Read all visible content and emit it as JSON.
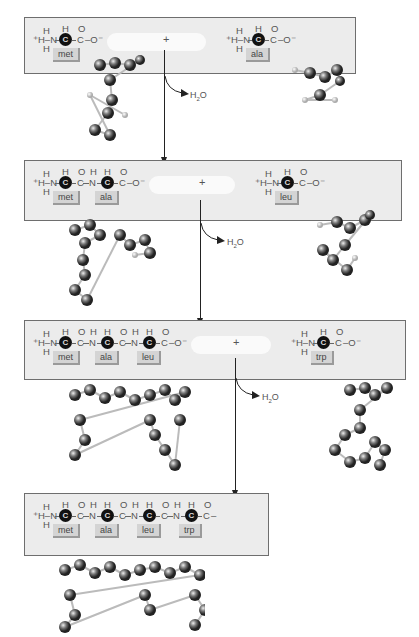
{
  "steps": [
    {
      "chain": [
        "met"
      ],
      "chain_terminal": "C–O⁻",
      "incoming": "ala",
      "byproduct": "H2O"
    },
    {
      "chain": [
        "met",
        "ala"
      ],
      "chain_terminal": "C–O⁻",
      "incoming": "leu",
      "byproduct": "H2O"
    },
    {
      "chain": [
        "met",
        "ala",
        "leu"
      ],
      "chain_terminal": "C–O⁻",
      "incoming": "trp",
      "byproduct": "H2O"
    },
    {
      "chain": [
        "met",
        "ala",
        "leu",
        "trp"
      ],
      "chain_terminal": "C–"
    }
  ],
  "labels": {
    "amino_n": "⁺H–N",
    "h": "H",
    "o": "O",
    "n": "N",
    "c": "C",
    "c_alpha": "C",
    "o_minus": "O⁻",
    "plus": "+",
    "water_h": "H",
    "water_sub": "2",
    "water_o": "O"
  },
  "residues": {
    "met": "met",
    "ala": "ala",
    "leu": "leu",
    "trp": "trp"
  }
}
